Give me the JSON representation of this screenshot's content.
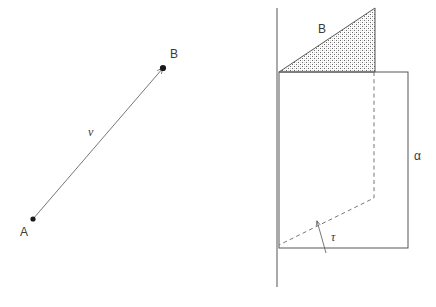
{
  "figure": {
    "background_color": "#ffffff",
    "line_color": "#555555",
    "label_color": "#3a3a3a",
    "dot_color": "#1a1a1a",
    "width": 436,
    "height": 307
  },
  "left_panel": {
    "name": "vector-diagram",
    "point_a_label": "A",
    "point_b_label": "B",
    "vector_label": "v",
    "point_a": {
      "x": 33,
      "y": 219
    },
    "point_b": {
      "x": 163,
      "y": 68
    },
    "point_a_label_pos": {
      "x": 20,
      "y": 236
    },
    "point_b_label_pos": {
      "x": 170,
      "y": 58
    },
    "vector_label_pos": {
      "x": 88,
      "y": 136
    },
    "arrow_from": {
      "x": 33,
      "y": 219
    },
    "arrow_to": {
      "x": 163,
      "y": 68
    }
  },
  "right_panel": {
    "name": "prism-diagram",
    "beta_label": "B",
    "alpha_label": "α",
    "tau_label": "τ",
    "beta_label_pos": {
      "x": 318,
      "y": 33
    },
    "alpha_label_pos": {
      "x": 414,
      "y": 160
    },
    "tau_label_pos": {
      "x": 331,
      "y": 241
    },
    "vertical_axis": {
      "x": 277,
      "y_top": 8,
      "y_bottom": 287
    },
    "triangle_points": "279,72 375,72 375,8",
    "triangle_fill": "stipple",
    "rectangle": {
      "x": 279,
      "y": 72,
      "width": 129,
      "height": 176
    },
    "dashed_vertical": {
      "x": 374,
      "y_top": 72,
      "y_bottom": 198
    },
    "dashed_diagonal": {
      "x1": 374,
      "y1": 198,
      "x2": 279,
      "y2": 245
    },
    "tau_arrow": {
      "x1": 326,
      "y1": 253,
      "x2": 317,
      "y2": 221
    }
  }
}
